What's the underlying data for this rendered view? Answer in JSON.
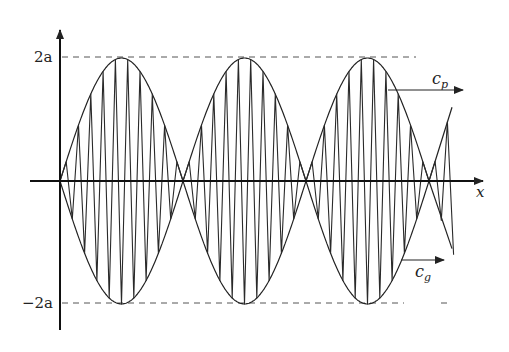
{
  "figure": {
    "labels": {
      "y_top": "2a",
      "y_bottom": "−2a",
      "x_axis": "x",
      "phase_velocity": "c",
      "phase_velocity_sub": "p",
      "group_velocity": "c",
      "group_velocity_sub": "g"
    },
    "colors": {
      "line": "#222222",
      "dashed": "#555555",
      "background": "#ffffff"
    },
    "geometry": {
      "origin_x": 60,
      "axis_y": 181,
      "amplitude_px": 123,
      "envelope_half_period_px": 123,
      "carrier_period_px": 12.3,
      "x_end": 456
    }
  }
}
